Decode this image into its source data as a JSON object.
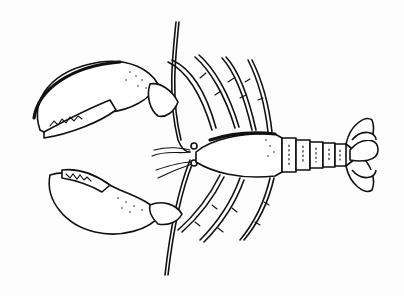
{
  "image": {
    "subject": "lobster",
    "style": "black-and-white line art illustration",
    "orientation": "claws facing left, tail facing right",
    "colors": {
      "background": "#fdfdfd",
      "ink": "#111111"
    },
    "parts": [
      "upper-claw",
      "lower-claw",
      "antennae",
      "carapace",
      "abdomen-segments",
      "tail-fan",
      "walking-legs"
    ]
  }
}
